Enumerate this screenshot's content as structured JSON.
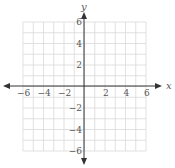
{
  "chart_data": {
    "type": "scatter",
    "title": "",
    "xlabel": "x",
    "ylabel": "y",
    "xlim": [
      -6,
      6
    ],
    "ylim": [
      -6,
      6
    ],
    "grid": true,
    "grid_step": 1,
    "x_ticks": [
      -6,
      -4,
      -2,
      2,
      4,
      6
    ],
    "y_ticks": [
      -6,
      -4,
      -2,
      2,
      4,
      6
    ],
    "x_tick_labels": [
      "−6",
      "−4",
      "−2",
      "2",
      "4",
      "6"
    ],
    "y_tick_labels": [
      "−6",
      "−4",
      "−2",
      "2",
      "4",
      "6"
    ],
    "series": [],
    "legend": null,
    "colors": {
      "grid": "#d9d9d9",
      "axis": "#333333",
      "text": "#555555"
    }
  }
}
